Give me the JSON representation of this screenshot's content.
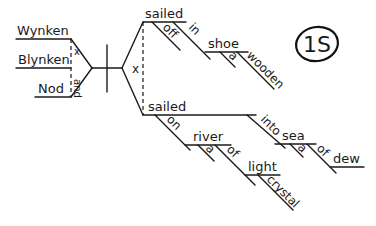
{
  "diagram": {
    "badge": "1S",
    "subjects": [
      "Wynken",
      "Blynken",
      "Nod"
    ],
    "subject_conjunction_marks": [
      "x",
      "and"
    ],
    "predicate_conjunction_mark": "x",
    "predicate_top": {
      "verb": "sailed",
      "modifiers": [
        "off",
        "in"
      ],
      "object": "shoe",
      "object_modifiers": [
        "a",
        "wooden"
      ]
    },
    "predicate_bottom": {
      "verb": "sailed",
      "prepositions": [
        "on",
        "into"
      ],
      "on_object": "river",
      "river_modifiers": [
        "a",
        "of"
      ],
      "of_object": "light",
      "light_modifier": "crystal",
      "into_object": "sea",
      "sea_modifiers": [
        "a",
        "of"
      ],
      "sea_of_object": "dew"
    }
  }
}
